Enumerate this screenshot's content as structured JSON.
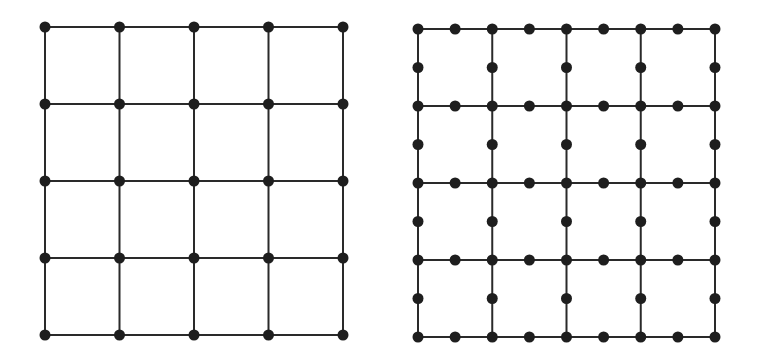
{
  "figure": {
    "width": 757,
    "height": 355,
    "line_color": "#2a2a2a",
    "node_color": "#1e1e1e",
    "line_width": 2,
    "node_radius": 5.5
  },
  "grids": [
    {
      "id": "coarse-grid",
      "description": "4x4 cell square grid with nodes only at intersections",
      "cells_x": 4,
      "cells_y": 4,
      "subdivisions": 1,
      "origin": [
        45,
        27
      ],
      "extent": [
        343,
        335
      ]
    },
    {
      "id": "refined-grid",
      "description": "4x4 cell square grid with nodes at intersections and edge midpoints",
      "cells_x": 4,
      "cells_y": 4,
      "subdivisions": 2,
      "origin": [
        418,
        29
      ],
      "extent": [
        715,
        337
      ]
    }
  ]
}
